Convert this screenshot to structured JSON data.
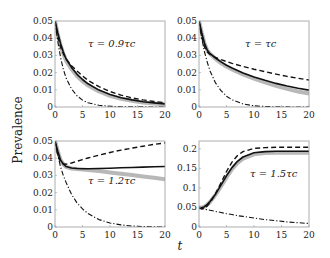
{
  "chart_data": {
    "type": "line",
    "ylabel": "Prevalence",
    "xlabel": "t",
    "panels": [
      {
        "id": "tl",
        "annotation": "τ = 0.9τc",
        "xlim": [
          0,
          20
        ],
        "ylim": [
          0,
          0.05
        ],
        "xticks": [
          0,
          5,
          10,
          15,
          20
        ],
        "yticks": [
          0,
          0.01,
          0.02,
          0.03,
          0.04,
          0.05
        ],
        "ytick_labels": [
          "0",
          "0.01",
          "0.02",
          "0.03",
          "0.04",
          "0.05"
        ],
        "x": [
          0,
          0.5,
          1,
          1.5,
          2,
          3,
          4,
          5,
          6,
          8,
          10,
          12,
          14,
          16,
          18,
          20
        ],
        "series": [
          {
            "name": "simulation (gray)",
            "style": "gray-thick",
            "values": [
              0.05,
              0.042,
              0.036,
              0.031,
              0.027,
              0.022,
              0.018,
              0.015,
              0.0125,
              0.009,
              0.0065,
              0.0048,
              0.0036,
              0.0027,
              0.002,
              0.0015
            ]
          },
          {
            "name": "solid",
            "style": "solid",
            "values": [
              0.05,
              0.043,
              0.037,
              0.032,
              0.028,
              0.023,
              0.019,
              0.016,
              0.0135,
              0.0098,
              0.0072,
              0.0054,
              0.0041,
              0.0031,
              0.0024,
              0.0018
            ]
          },
          {
            "name": "dashed",
            "style": "dashed",
            "values": [
              0.05,
              0.041,
              0.035,
              0.031,
              0.028,
              0.024,
              0.021,
              0.018,
              0.0155,
              0.0118,
              0.009,
              0.0069,
              0.0053,
              0.0041,
              0.0032,
              0.0025
            ]
          },
          {
            "name": "dash-dot",
            "style": "dashdot",
            "values": [
              0.05,
              0.038,
              0.029,
              0.022,
              0.017,
              0.0105,
              0.0065,
              0.004,
              0.0025,
              0.001,
              0.0004,
              0.0002,
              0.0001,
              5e-05,
              2e-05,
              0.0
            ]
          }
        ]
      },
      {
        "id": "tr",
        "annotation": "τ = τc",
        "xlim": [
          0,
          20
        ],
        "ylim": [
          0,
          0.05
        ],
        "xticks": [
          0,
          5,
          10,
          15,
          20
        ],
        "yticks": [
          0,
          0.01,
          0.02,
          0.03,
          0.04,
          0.05
        ],
        "ytick_labels": [
          "0",
          "0.01",
          "0.02",
          "0.03",
          "0.04",
          "0.05"
        ],
        "x": [
          0,
          0.5,
          1,
          1.5,
          2,
          3,
          4,
          5,
          6,
          8,
          10,
          12,
          14,
          16,
          18,
          20
        ],
        "series": [
          {
            "name": "simulation (gray)",
            "style": "gray-thick",
            "values": [
              0.05,
              0.043,
              0.037,
              0.033,
              0.031,
              0.028,
              0.0255,
              0.0235,
              0.0218,
              0.019,
              0.0165,
              0.0143,
              0.0123,
              0.0105,
              0.009,
              0.0078
            ]
          },
          {
            "name": "solid",
            "style": "solid",
            "values": [
              0.05,
              0.043,
              0.037,
              0.033,
              0.031,
              0.0285,
              0.0262,
              0.0243,
              0.0227,
              0.0198,
              0.0175,
              0.0155,
              0.0137,
              0.0122,
              0.0109,
              0.0098
            ]
          },
          {
            "name": "dashed",
            "style": "dashed",
            "values": [
              0.05,
              0.041,
              0.035,
              0.032,
              0.0305,
              0.0288,
              0.0275,
              0.0264,
              0.0254,
              0.0236,
              0.022,
              0.0205,
              0.0191,
              0.0178,
              0.0167,
              0.0157
            ]
          },
          {
            "name": "dash-dot",
            "style": "dashdot",
            "values": [
              0.05,
              0.04,
              0.032,
              0.026,
              0.021,
              0.014,
              0.0095,
              0.0063,
              0.0042,
              0.0018,
              0.0007,
              0.0003,
              0.0001,
              5e-05,
              2e-05,
              0.0
            ]
          }
        ]
      },
      {
        "id": "bl",
        "annotation": "τ = 1.2τc",
        "xlim": [
          0,
          20
        ],
        "ylim": [
          0,
          0.05
        ],
        "xticks": [
          0,
          5,
          10,
          15,
          20
        ],
        "yticks": [
          0,
          0.01,
          0.02,
          0.03,
          0.04,
          0.05
        ],
        "ytick_labels": [
          "0",
          "0.01",
          "0.02",
          "0.03",
          "0.04",
          "0.05"
        ],
        "x": [
          0,
          0.5,
          1,
          1.5,
          2,
          3,
          4,
          5,
          6,
          8,
          10,
          12,
          14,
          16,
          18,
          20
        ],
        "series": [
          {
            "name": "simulation (gray)",
            "style": "gray-thick",
            "values": [
              0.05,
              0.044,
              0.039,
              0.0365,
              0.035,
              0.034,
              0.0337,
              0.0335,
              0.0332,
              0.0325,
              0.0317,
              0.031,
              0.0302,
              0.0294,
              0.0286,
              0.0278
            ]
          },
          {
            "name": "solid",
            "style": "solid",
            "values": [
              0.05,
              0.044,
              0.039,
              0.0365,
              0.0352,
              0.0343,
              0.034,
              0.0339,
              0.0339,
              0.034,
              0.0342,
              0.0344,
              0.0346,
              0.0348,
              0.035,
              0.0352
            ]
          },
          {
            "name": "dashed",
            "style": "dashed",
            "values": [
              0.05,
              0.042,
              0.038,
              0.0368,
              0.0365,
              0.0372,
              0.0382,
              0.0392,
              0.0401,
              0.0418,
              0.0433,
              0.0447,
              0.0459,
              0.047,
              0.048,
              0.0489
            ]
          },
          {
            "name": "dash-dot",
            "style": "dashdot",
            "values": [
              0.05,
              0.042,
              0.035,
              0.03,
              0.026,
              0.019,
              0.014,
              0.0105,
              0.0078,
              0.0043,
              0.0023,
              0.0012,
              0.0006,
              0.0003,
              0.0001,
              0.0
            ]
          }
        ]
      },
      {
        "id": "br",
        "annotation": "τ = 1.5τc",
        "xlim": [
          0,
          20
        ],
        "ylim": [
          0,
          0.22
        ],
        "xticks": [
          0,
          5,
          10,
          15,
          20
        ],
        "yticks": [
          0,
          0.05,
          0.1,
          0.15,
          0.2
        ],
        "ytick_labels": [
          "0",
          "0.05",
          "0.1",
          "0.15",
          "0.2"
        ],
        "x": [
          0,
          0.5,
          1,
          1.5,
          2,
          3,
          4,
          5,
          6,
          7,
          8,
          10,
          12,
          14,
          16,
          18,
          20
        ],
        "series": [
          {
            "name": "simulation (gray)",
            "style": "gray-thick",
            "values": [
              0.05,
              0.049,
              0.052,
              0.057,
              0.064,
              0.082,
              0.104,
              0.127,
              0.148,
              0.164,
              0.175,
              0.186,
              0.189,
              0.19,
              0.19,
              0.19,
              0.19
            ]
          },
          {
            "name": "solid",
            "style": "solid",
            "values": [
              0.05,
              0.049,
              0.052,
              0.058,
              0.065,
              0.084,
              0.107,
              0.131,
              0.152,
              0.168,
              0.179,
              0.19,
              0.193,
              0.194,
              0.194,
              0.194,
              0.194
            ]
          },
          {
            "name": "dashed",
            "style": "dashed",
            "values": [
              0.05,
              0.046,
              0.048,
              0.054,
              0.062,
              0.085,
              0.113,
              0.142,
              0.166,
              0.183,
              0.193,
              0.201,
              0.203,
              0.204,
              0.204,
              0.204,
              0.204
            ]
          },
          {
            "name": "dash-dot",
            "style": "dashdot",
            "values": [
              0.05,
              0.048,
              0.046,
              0.044,
              0.043,
              0.04,
              0.037,
              0.034,
              0.032,
              0.029,
              0.027,
              0.023,
              0.019,
              0.016,
              0.013,
              0.011,
              0.009
            ]
          }
        ]
      }
    ],
    "grid": false,
    "legend": "none"
  }
}
